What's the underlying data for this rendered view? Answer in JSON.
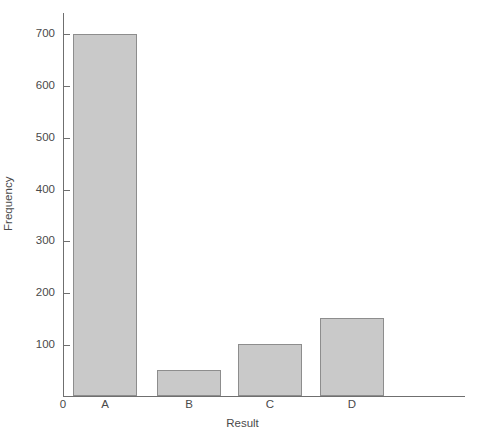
{
  "chart_data": {
    "type": "bar",
    "title": "",
    "subtitle": "",
    "categories": [
      "A",
      "B",
      "C",
      "D"
    ],
    "values": [
      700,
      50,
      100,
      150
    ],
    "xlabel": "Result",
    "ylabel": "Frequency",
    "ylim": [
      0,
      700
    ],
    "y_ticks": [
      0,
      100,
      200,
      300,
      400,
      500,
      600,
      700
    ],
    "y_tick_labels": [
      "0",
      "100",
      "200",
      "300",
      "400",
      "500",
      "600",
      "700"
    ],
    "grid": false,
    "legend": null,
    "bar_fill_color": "#c9c9c9",
    "bar_border_color": "#8d8d8d",
    "axis_color": "#6f6f6f",
    "text_color": "#4a4a4a",
    "background_color": "#ffffff"
  },
  "axes": {
    "y_title": "Frequency",
    "x_title": "Result",
    "origin_label": "0"
  },
  "ticks": {
    "labels": [
      "700",
      "600",
      "500",
      "400",
      "300",
      "200",
      "100"
    ]
  },
  "bars": [
    {
      "label": "A",
      "value": 700
    },
    {
      "label": "B",
      "value": 50
    },
    {
      "label": "C",
      "value": 100
    },
    {
      "label": "D",
      "value": 150
    }
  ]
}
